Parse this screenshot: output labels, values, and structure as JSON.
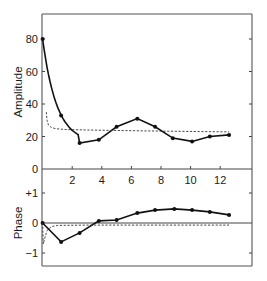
{
  "chart_data": [
    {
      "type": "line",
      "panel": "top",
      "title": "",
      "xlabel": "",
      "ylabel": "Amplitude",
      "xlim": [
        0,
        14.15
      ],
      "ylim": [
        0,
        95
      ],
      "x_ticks": [
        2,
        4,
        6,
        8,
        10,
        12
      ],
      "y_ticks": [
        0,
        20,
        40,
        60,
        80
      ],
      "grid": false,
      "legend": null,
      "series": [
        {
          "name": "measured",
          "style": "solid-with-markers",
          "x": [
            0,
            1.25,
            2.5,
            3.8,
            5.0,
            6.4,
            7.6,
            8.8,
            10.1,
            11.3,
            12.6
          ],
          "values": [
            80,
            33,
            16,
            18,
            26,
            31,
            26,
            19,
            17,
            20,
            21
          ]
        },
        {
          "name": "model",
          "style": "dashed",
          "x": [
            0.25,
            0.3,
            0.4,
            0.6,
            0.9,
            1.5,
            3,
            6,
            9,
            12.6
          ],
          "values": [
            35,
            30,
            27,
            25.5,
            24.8,
            24.3,
            24,
            23.6,
            23.2,
            22.8
          ]
        }
      ]
    },
    {
      "type": "line",
      "panel": "bottom",
      "title": "",
      "xlabel": "",
      "ylabel": "Phase",
      "xlim": [
        0,
        14.15
      ],
      "ylim": [
        -1.4,
        1.0
      ],
      "y_ticks": [
        1,
        0,
        -1
      ],
      "y_tick_labels": [
        "+1",
        "0",
        "−1"
      ],
      "grid": false,
      "legend": null,
      "series": [
        {
          "name": "measured",
          "style": "solid-with-markers",
          "x": [
            0,
            1.25,
            2.5,
            3.8,
            5.0,
            6.4,
            7.6,
            8.9,
            10.1,
            11.3,
            12.6
          ],
          "values": [
            0,
            -0.63,
            -0.33,
            0.07,
            0.1,
            0.33,
            0.43,
            0.47,
            0.43,
            0.37,
            0.27
          ]
        },
        {
          "name": "model",
          "style": "dashed",
          "x": [
            0,
            0.05,
            0.12,
            0.3,
            0.6,
            1.0,
            3,
            6,
            9,
            12.6
          ],
          "values": [
            0,
            -0.7,
            -0.55,
            -0.25,
            -0.12,
            -0.08,
            -0.07,
            -0.07,
            -0.07,
            -0.07
          ]
        }
      ]
    }
  ],
  "labels": {
    "amplitude_axis": "Amplitude",
    "phase_axis": "Phase",
    "amp_ticks": [
      "0",
      "20",
      "40",
      "60",
      "80"
    ],
    "x_ticks": [
      "2",
      "4",
      "6",
      "8",
      "10",
      "12"
    ],
    "phase_ticks": [
      "+1",
      "0",
      "−1"
    ]
  }
}
